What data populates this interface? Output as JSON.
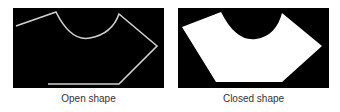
{
  "figures": [
    {
      "caption": "Open shape",
      "style": "outline",
      "stroke_color": "#d0d0d0"
    },
    {
      "caption": "Closed shape",
      "style": "filled",
      "fill_color": "#ffffff"
    }
  ]
}
